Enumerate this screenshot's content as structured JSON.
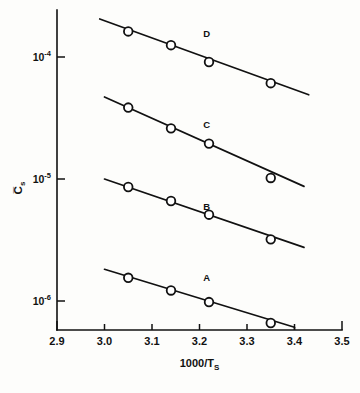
{
  "figure": {
    "background_color": "#fdfdfb",
    "ink_color": "#111111",
    "caption_fragment": ""
  },
  "chart_data": {
    "type": "scatter",
    "title": "",
    "subtitle": "",
    "xlabel": "1000/T",
    "xlabel_sub": "S",
    "ylabel": "Cs",
    "ylabel_display": "C̅s",
    "yscale": "log",
    "xscale": "linear",
    "xlim": [
      2.9,
      3.5
    ],
    "ylim": [
      3.3e-07,
      0.00026
    ],
    "grid": false,
    "legend": "inline-series-labels",
    "xticks": [
      2.9,
      3.0,
      3.1,
      3.2,
      3.3,
      3.4,
      3.5
    ],
    "xticklabels": [
      "2.9",
      "3.0",
      "3.1",
      "3.2",
      "3.3",
      "3.4",
      "3.5"
    ],
    "yticks": [
      0.0001,
      1e-05,
      1e-06
    ],
    "yticklabels": [
      "10-4",
      "10-5",
      "10-6"
    ],
    "ytick_mantissa": [
      "10",
      "10",
      "10"
    ],
    "ytick_exponent": [
      "-4",
      "-5",
      "-6"
    ],
    "marker_style": "open-circle",
    "series": [
      {
        "name": "A",
        "label": "A",
        "label_x": 3.215,
        "label_y": 1.45e-06,
        "x": [
          3.05,
          3.14,
          3.22,
          3.35
        ],
        "y": [
          1.55e-06,
          1.22e-06,
          9.8e-07,
          6.6e-07
        ],
        "fit_x": [
          3.0,
          3.4
        ],
        "fit_y": [
          1.82e-06,
          6.1e-07
        ],
        "terminator_x": 3.4,
        "has_axis_drop": true
      },
      {
        "name": "B",
        "label": "B",
        "label_x": 3.215,
        "label_y": 5.6e-06,
        "x": [
          3.05,
          3.14,
          3.22,
          3.35
        ],
        "y": [
          8.6e-06,
          6.6e-06,
          5.1e-06,
          3.2e-06
        ],
        "fit_x": [
          3.0,
          3.42
        ],
        "fit_y": [
          1e-05,
          2.75e-06
        ],
        "has_axis_drop": false
      },
      {
        "name": "C",
        "label": "C",
        "label_x": 3.215,
        "label_y": 2.6e-05,
        "x": [
          3.05,
          3.14,
          3.22,
          3.35
        ],
        "y": [
          3.85e-05,
          2.6e-05,
          1.95e-05,
          1.02e-05
        ],
        "fit_x": [
          3.0,
          3.42
        ],
        "fit_y": [
          4.7e-05,
          8.7e-06
        ],
        "has_axis_drop": false
      },
      {
        "name": "D",
        "label": "D",
        "label_x": 3.215,
        "label_y": 0.000145,
        "x": [
          3.05,
          3.14,
          3.22,
          3.35
        ],
        "y": [
          0.000162,
          0.000125,
          9.1e-05,
          6.1e-05
        ],
        "fit_x": [
          2.99,
          3.43
        ],
        "fit_y": [
          0.000205,
          4.9e-05
        ],
        "has_axis_drop": false
      }
    ]
  }
}
